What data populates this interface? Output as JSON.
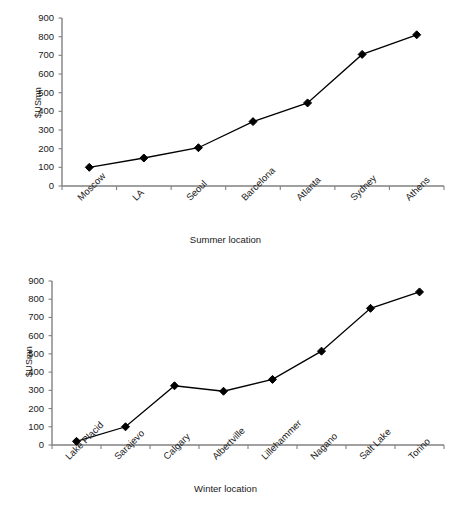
{
  "page": {
    "background": "#ffffff",
    "line_color": "#000000",
    "axis_color": "#808080",
    "text_color": "#1a1a1a"
  },
  "chart_data": [
    {
      "id": "summer",
      "type": "line",
      "title": "",
      "xlabel": "Summer location",
      "ylabel": "$USmn",
      "ylim": [
        0,
        900
      ],
      "ytick_step": 100,
      "yticks": [
        "0",
        "100",
        "200",
        "300",
        "400",
        "500",
        "600",
        "700",
        "800",
        "900"
      ],
      "grid": false,
      "legend": "none",
      "marker": "diamond",
      "categories": [
        "Moscow",
        "LA",
        "Seoul",
        "Barcelona",
        "Atlanta",
        "Sydney",
        "Athens"
      ],
      "values": [
        100,
        150,
        205,
        345,
        445,
        705,
        810
      ]
    },
    {
      "id": "winter",
      "type": "line",
      "title": "",
      "xlabel": "Winter location",
      "ylabel": "$USmn",
      "ylim": [
        0,
        900
      ],
      "ytick_step": 100,
      "yticks": [
        "0",
        "100",
        "200",
        "300",
        "400",
        "500",
        "600",
        "700",
        "800",
        "900"
      ],
      "grid": false,
      "legend": "none",
      "marker": "diamond",
      "categories": [
        "Lake Placid",
        "Sarajevo",
        "Calgary",
        "Albertville",
        "Lillehammer",
        "Nagano",
        "Salt Lake",
        "Torino"
      ],
      "values": [
        20,
        100,
        325,
        295,
        360,
        515,
        750,
        840
      ]
    }
  ]
}
